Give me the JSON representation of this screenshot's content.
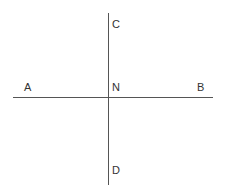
{
  "diagram": {
    "lines": [
      {
        "id": "AB",
        "x1": 13,
        "y1": 97.5,
        "x2": 213,
        "y2": 97.5
      },
      {
        "id": "CD",
        "x1": 108.5,
        "y1": 13,
        "x2": 108.5,
        "y2": 185
      }
    ],
    "points": [
      {
        "label": "A",
        "x": 24,
        "y": 91
      },
      {
        "label": "N",
        "x": 112,
        "y": 91
      },
      {
        "label": "B",
        "x": 197,
        "y": 91
      },
      {
        "label": "C",
        "x": 112,
        "y": 28
      },
      {
        "label": "D",
        "x": 112,
        "y": 174
      }
    ],
    "colors": {
      "line": "#555555",
      "text": "#333333",
      "background": "#ffffff"
    }
  }
}
